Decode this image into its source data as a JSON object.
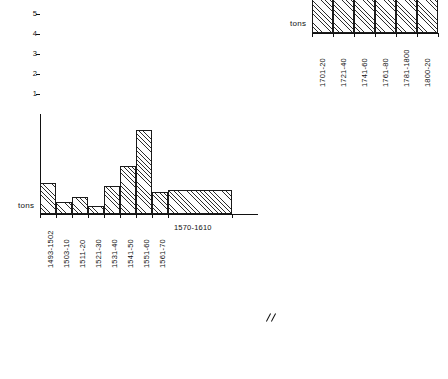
{
  "figure": {
    "background": "#ffffff",
    "ink": "#111111",
    "axis_break_symbol": "//"
  },
  "chart_data": [
    {
      "id": "left",
      "type": "bar",
      "title": "",
      "xlabel": "",
      "ylabel": "tons",
      "unit_label": "tons",
      "ylim": [
        0,
        5
      ],
      "yticks": [
        1,
        2,
        3,
        4,
        5
      ],
      "ytick_labels": [
        "1",
        "2",
        "3",
        "4",
        "5"
      ],
      "grid": false,
      "legend": "none",
      "categories": [
        "1493-1502",
        "1503-10",
        "1511-20",
        "1521-30",
        "1531-40",
        "1541-50",
        "1551-60",
        "1561-70",
        "1570-1610"
      ],
      "values": [
        1.55,
        0.6,
        0.85,
        0.4,
        1.4,
        2.4,
        4.2,
        1.1,
        1.2
      ],
      "bar_widths": [
        1,
        1,
        1,
        1,
        1,
        1,
        1,
        1,
        4
      ],
      "label_orientation": [
        "vertical",
        "vertical",
        "vertical",
        "vertical",
        "vertical",
        "vertical",
        "vertical",
        "vertical",
        "horizontal"
      ]
    },
    {
      "id": "right",
      "type": "bar",
      "title": "",
      "xlabel": "",
      "ylabel": "tons",
      "unit_label": "tons",
      "ylim": [
        0,
        15
      ],
      "yticks": [
        1,
        2,
        3,
        4,
        5,
        6,
        7,
        8,
        9,
        10,
        11,
        12,
        13,
        14,
        15
      ],
      "ytick_labels": [
        "1",
        "2",
        "3",
        "4",
        "5",
        "6",
        "7",
        "8",
        "9",
        "10",
        "11",
        "12",
        "13",
        "14",
        "15"
      ],
      "grid": false,
      "legend": "none",
      "categories": [
        "1701-20",
        "1721-40",
        "1741-60",
        "1761-80",
        "1781-1800",
        "1800-20"
      ],
      "values": [
        2.75,
        8.9,
        14.6,
        10.35,
        5.4,
        2.75
      ],
      "bar_widths": [
        1,
        1,
        1,
        1,
        1,
        1
      ],
      "label_orientation": [
        "vertical",
        "vertical",
        "vertical",
        "vertical",
        "vertical",
        "vertical"
      ]
    }
  ]
}
